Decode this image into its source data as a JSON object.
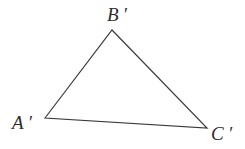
{
  "figure": {
    "type": "geometry-diagram",
    "shape": "triangle",
    "background_color": "#ffffff",
    "stroke_color": "#3a3a3a",
    "stroke_width": 1.2,
    "canvas": {
      "width": 245,
      "height": 149
    },
    "vertices": [
      {
        "id": "A",
        "label": "A ′",
        "x": 45,
        "y": 118,
        "label_x": 12,
        "label_y": 113
      },
      {
        "id": "B",
        "label": "B ′",
        "x": 112,
        "y": 30,
        "label_x": 107,
        "label_y": 5
      },
      {
        "id": "C",
        "label": "C ′",
        "x": 207,
        "y": 128,
        "label_x": 211,
        "label_y": 124
      }
    ],
    "edges": [
      {
        "from": "A",
        "to": "B"
      },
      {
        "from": "B",
        "to": "C"
      },
      {
        "from": "C",
        "to": "A"
      }
    ],
    "path": "M 45 118 L 112 30 L 207 128 Z"
  }
}
